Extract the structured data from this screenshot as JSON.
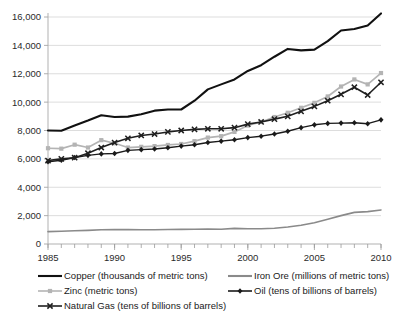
{
  "chart_data": {
    "type": "line",
    "title": "",
    "xlabel": "",
    "ylabel": "",
    "grid": "horizontal",
    "legend_position": "bottom",
    "xlim": [
      1985,
      2010
    ],
    "ylim": [
      0,
      16000
    ],
    "y_ticks": [
      0,
      2000,
      4000,
      6000,
      8000,
      10000,
      12000,
      14000,
      16000
    ],
    "y_tick_labels": [
      "0",
      "2,000",
      "4,000",
      "6,000",
      "8,000",
      "10,000",
      "12,000",
      "14,000",
      "16,000"
    ],
    "x_ticks": [
      1985,
      1990,
      1995,
      2000,
      2005,
      2010
    ],
    "x_tick_labels": [
      "1985",
      "1990",
      "1995",
      "2000",
      "2005",
      "2010"
    ],
    "x": [
      1985,
      1986,
      1987,
      1988,
      1989,
      1990,
      1991,
      1992,
      1993,
      1994,
      1995,
      1996,
      1997,
      1998,
      1999,
      2000,
      2001,
      2002,
      2003,
      2004,
      2005,
      2006,
      2007,
      2008,
      2009,
      2010
    ],
    "series": [
      {
        "name": "Copper (thousands of metric tons)",
        "color": "#111111",
        "width": 2.1,
        "marker": "none",
        "values": [
          8000,
          7980,
          8350,
          8700,
          9080,
          8950,
          8980,
          9150,
          9400,
          9480,
          9480,
          10100,
          10900,
          11250,
          11600,
          12200,
          12600,
          13200,
          13750,
          13650,
          13700,
          14300,
          15050,
          15150,
          15400,
          16250
        ]
      },
      {
        "name": "Iron Ore (millions of metric tons)",
        "color": "#8a8a8a",
        "width": 1.6,
        "marker": "none",
        "values": [
          870,
          900,
          930,
          960,
          1000,
          1010,
          1010,
          1000,
          1000,
          1020,
          1030,
          1040,
          1060,
          1040,
          1100,
          1070,
          1070,
          1110,
          1200,
          1320,
          1500,
          1750,
          2000,
          2230,
          2280,
          2400
        ]
      },
      {
        "name": "Zinc (metric tons)",
        "color": "#b4b4b4",
        "width": 1.7,
        "marker": "square",
        "values": [
          6750,
          6720,
          7000,
          6800,
          7320,
          7100,
          6800,
          6850,
          6900,
          6980,
          7050,
          7250,
          7500,
          7600,
          7900,
          8350,
          8600,
          8950,
          9250,
          9600,
          9950,
          10400,
          11100,
          11600,
          11250,
          12050
        ]
      },
      {
        "name": "Oil (tens of billions of barrels)",
        "color": "#1a1a1a",
        "width": 1.4,
        "marker": "diamond",
        "values": [
          5800,
          5900,
          6100,
          6250,
          6350,
          6380,
          6600,
          6650,
          6700,
          6780,
          6900,
          7000,
          7150,
          7250,
          7350,
          7500,
          7600,
          7750,
          7950,
          8200,
          8400,
          8500,
          8520,
          8550,
          8480,
          8750
        ]
      },
      {
        "name": "Natural Gas (tens of billions of barrels)",
        "color": "#1f1f1f",
        "width": 1.6,
        "marker": "x",
        "values": [
          5880,
          6000,
          6080,
          6400,
          6800,
          7150,
          7450,
          7650,
          7750,
          7900,
          8000,
          8080,
          8120,
          8120,
          8200,
          8450,
          8600,
          8800,
          9000,
          9350,
          9700,
          10100,
          10550,
          11050,
          10500,
          11400
        ]
      }
    ]
  },
  "legend": {
    "entries": [
      {
        "label": "Copper (thousands of metric tons)",
        "marker": "none",
        "color": "#111111"
      },
      {
        "label": "Iron Ore (millions of metric tons)",
        "marker": "none",
        "color": "#8a8a8a"
      },
      {
        "label": "Zinc (metric tons)",
        "marker": "square",
        "color": "#b4b4b4"
      },
      {
        "label": "Oil (tens of billions of barrels)",
        "marker": "diamond",
        "color": "#1a1a1a"
      },
      {
        "label": "Natural Gas (tens of billions of barrels)",
        "marker": "x",
        "color": "#1f1f1f"
      }
    ]
  }
}
